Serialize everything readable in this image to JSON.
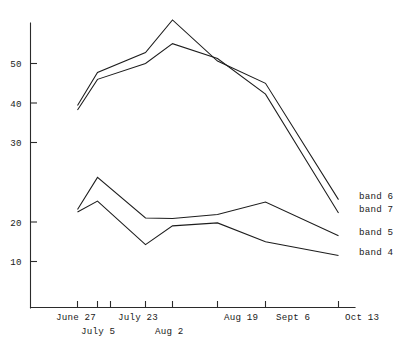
{
  "chart_data": {
    "type": "line",
    "title": "",
    "subtitle": "",
    "xlabel": "",
    "ylabel": "",
    "grid": false,
    "legend_position": "right",
    "ylim": [
      0,
      60
    ],
    "yticks": [
      10,
      20,
      30,
      40,
      50
    ],
    "ytick_labels": [
      "10",
      "20",
      "30",
      "40",
      "50"
    ],
    "x_categories": [
      "June 27",
      "July 5",
      "July 23",
      "Aug 2",
      "Aug 19",
      "Sept 6",
      "Oct 13"
    ],
    "x_tick_labels_row1": [
      "June 27",
      "July 23",
      "Aug 19",
      "Sept 6",
      "Oct 13"
    ],
    "x_tick_labels_row2": [
      "July 5",
      "Aug 2"
    ],
    "series": [
      {
        "name": "band 6",
        "values": [
          41.5,
          48.2,
          52.2,
          58.8,
          50.5,
          46.0,
          22.5
        ]
      },
      {
        "name": "band 7",
        "values": [
          40.6,
          46.8,
          50.0,
          54.0,
          51.0,
          43.8,
          19.8
        ]
      },
      {
        "name": "band 5",
        "values": [
          20.5,
          27.0,
          18.8,
          18.7,
          19.5,
          22.0,
          15.2
        ]
      },
      {
        "name": "band 4",
        "values": [
          20.0,
          22.2,
          13.4,
          17.2,
          17.8,
          14.0,
          11.2
        ]
      }
    ],
    "legend_entries": [
      "band 6",
      "band 7",
      "band 5",
      "band 4"
    ],
    "colors": {
      "line": "#1d1d1d",
      "axis": "#2b2b2b",
      "background": "#ffffff",
      "text": "#1a1a1a"
    }
  },
  "labels": {
    "ytick_50": "50",
    "ytick_40": "40",
    "ytick_30": "30",
    "ytick_20": "20",
    "ytick_10": "10",
    "xtick_june27": "June  27",
    "xtick_july5": "July  5",
    "xtick_july23": "July  23",
    "xtick_aug2": "Aug  2",
    "xtick_aug19": "Aug  19",
    "xtick_sept6": "Sept  6",
    "xtick_oct13": "Oct  13",
    "legend_band6": "band  6",
    "legend_band7": "band  7",
    "legend_band5": "band  5",
    "legend_band4": "band  4"
  }
}
